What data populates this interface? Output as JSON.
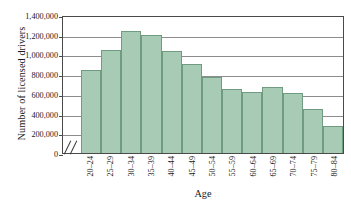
{
  "chart_data": {
    "type": "bar",
    "title": "",
    "xlabel": "Age",
    "ylabel": "Number of licensed drivers",
    "categories": [
      "20–24",
      "25–29",
      "30–34",
      "35–39",
      "40–44",
      "45–49",
      "50–54",
      "55–59",
      "60–64",
      "65–69",
      "70–74",
      "75–79",
      "80–84"
    ],
    "values": [
      840000,
      1050000,
      1235000,
      1200000,
      1035000,
      905000,
      770000,
      650000,
      620000,
      670000,
      608000,
      450000,
      275000
    ],
    "ylim": [
      0,
      1400000
    ],
    "ytick_values": [
      0,
      200000,
      400000,
      600000,
      800000,
      1000000,
      1200000,
      1400000
    ],
    "ytick_labels": [
      "0",
      "200,000",
      "400,000",
      "600,000",
      "800,000",
      "1,000,000",
      "1,200,000",
      "1,400,000"
    ],
    "grid": true,
    "legend": "none",
    "axis_break": true,
    "bar_color": "#a8cbb5",
    "bar_edge_color": "#6f9b81",
    "grid_color": "#8d8d8d",
    "axis_color": "#4a4a4a"
  }
}
